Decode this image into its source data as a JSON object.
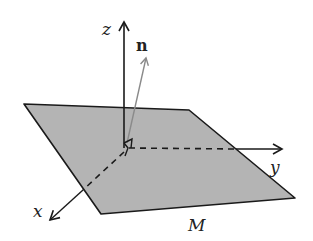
{
  "diagram": {
    "type": "3d-coordinate-plane-with-normal",
    "labels": {
      "z_axis": "z",
      "y_axis": "y",
      "x_axis": "x",
      "normal": "n",
      "plane": "M"
    },
    "colors": {
      "plane_fill": "#b4b4b4",
      "stroke": "#1a1a1a",
      "normal_vector": "#8a8a8a",
      "background": "#ffffff"
    }
  }
}
